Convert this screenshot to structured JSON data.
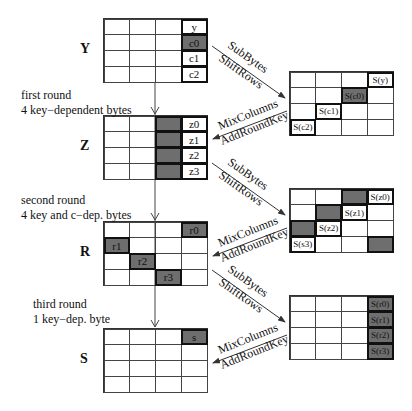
{
  "left_states": [
    {
      "name": "Y",
      "top": 18,
      "cells": [
        [
          "",
          "",
          "",
          "y"
        ],
        [
          "",
          "",
          "",
          "c0"
        ],
        [
          "",
          "",
          "",
          "c1"
        ],
        [
          "",
          "",
          "",
          "c2"
        ]
      ],
      "dark": [
        [
          1,
          3
        ]
      ],
      "bold": [
        [
          0,
          3
        ],
        [
          1,
          3
        ],
        [
          2,
          3
        ],
        [
          3,
          3
        ]
      ]
    },
    {
      "name": "Z",
      "top": 115,
      "cells": [
        [
          "",
          "",
          "",
          "z0"
        ],
        [
          "",
          "",
          "",
          "z1"
        ],
        [
          "",
          "",
          "",
          "z2"
        ],
        [
          "",
          "",
          "",
          "z3"
        ]
      ],
      "dark": [
        [
          0,
          2
        ],
        [
          1,
          2
        ],
        [
          2,
          2
        ],
        [
          3,
          2
        ]
      ],
      "bold": [
        [
          0,
          2
        ],
        [
          1,
          2
        ],
        [
          2,
          2
        ],
        [
          3,
          2
        ],
        [
          0,
          3
        ],
        [
          1,
          3
        ],
        [
          2,
          3
        ],
        [
          3,
          3
        ]
      ]
    },
    {
      "name": "R",
      "top": 221,
      "cells": [
        [
          "",
          "",
          "",
          "r0"
        ],
        [
          "r1",
          "",
          "",
          ""
        ],
        [
          "",
          "r2",
          "",
          ""
        ],
        [
          "",
          "",
          "r3",
          ""
        ]
      ],
      "dark": [
        [
          0,
          3
        ],
        [
          1,
          0
        ],
        [
          2,
          1
        ],
        [
          3,
          2
        ]
      ],
      "bold": [
        [
          0,
          3
        ],
        [
          1,
          0
        ],
        [
          2,
          1
        ],
        [
          3,
          2
        ]
      ]
    },
    {
      "name": "S",
      "top": 328,
      "cells": [
        [
          "",
          "",
          "",
          "s"
        ],
        [
          "",
          "",
          "",
          ""
        ],
        [
          "",
          "",
          "",
          ""
        ],
        [
          "",
          "",
          "",
          ""
        ]
      ],
      "dark": [
        [
          0,
          3
        ]
      ],
      "bold": [
        [
          0,
          3
        ]
      ]
    }
  ],
  "right_states": [
    {
      "top": 71,
      "cells": [
        [
          "",
          "",
          "",
          "S(y)"
        ],
        [
          "",
          "",
          "S(c0)",
          ""
        ],
        [
          "",
          "S(c1)",
          "",
          ""
        ],
        [
          "S(c2)",
          "",
          "",
          ""
        ]
      ],
      "dark": [
        [
          1,
          2
        ]
      ],
      "bold": [
        [
          0,
          3
        ],
        [
          1,
          2
        ],
        [
          2,
          1
        ],
        [
          3,
          0
        ]
      ]
    },
    {
      "top": 188,
      "cells": [
        [
          "",
          "",
          "",
          "S(z0)"
        ],
        [
          "",
          "",
          "S(z1)",
          ""
        ],
        [
          "",
          "S(z2)",
          "",
          ""
        ],
        [
          "S(s3)",
          "",
          "",
          ""
        ]
      ],
      "dark": [
        [
          0,
          2
        ],
        [
          1,
          1
        ],
        [
          2,
          0
        ],
        [
          3,
          3
        ]
      ],
      "bold": [
        [
          0,
          2
        ],
        [
          0,
          3
        ],
        [
          1,
          1
        ],
        [
          1,
          2
        ],
        [
          2,
          0
        ],
        [
          2,
          1
        ],
        [
          3,
          0
        ],
        [
          3,
          3
        ]
      ]
    },
    {
      "top": 295,
      "cells": [
        [
          "",
          "",
          "",
          "S(r0)"
        ],
        [
          "",
          "",
          "",
          "S(r1)"
        ],
        [
          "",
          "",
          "",
          "S(r2)"
        ],
        [
          "",
          "",
          "",
          "S(r3)"
        ]
      ],
      "dark": [
        [
          0,
          3
        ],
        [
          1,
          3
        ],
        [
          2,
          3
        ],
        [
          3,
          3
        ]
      ],
      "bold": [
        [
          0,
          3
        ],
        [
          1,
          3
        ],
        [
          2,
          3
        ],
        [
          3,
          3
        ]
      ]
    }
  ],
  "notes": [
    {
      "id": "round1",
      "top": 88,
      "lines": [
        "first round",
        "4 key−dependent bytes"
      ]
    },
    {
      "id": "round2",
      "top": 193,
      "lines": [
        "second round",
        "4 key and c−dep. bytes"
      ]
    },
    {
      "id": "round3",
      "top": 297,
      "lines": [
        "third round",
        "1 key−dep. byte"
      ]
    }
  ],
  "arrows": {
    "forward_top": "SubBytes",
    "forward_bottom": "ShiftRows",
    "back_top": "MixColumns",
    "back_bottom": "AddRoundKey",
    "offsets": [
      0,
      117,
      224
    ]
  },
  "colors": {
    "dark_cell": "#6e6e6e",
    "line": "#333333"
  }
}
